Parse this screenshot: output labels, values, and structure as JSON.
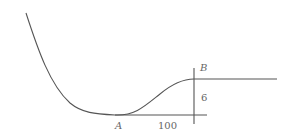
{
  "diagram": {
    "type": "curve-profile",
    "stroke_color": "#555555",
    "labels": {
      "point_a": "A",
      "point_b": "B",
      "height": "6",
      "length": "100"
    },
    "elements": [
      {
        "kind": "curve",
        "description": "steep descent from upper-left, flattening into minimum at A, then S-shaped rise to B"
      },
      {
        "kind": "horizontal-line",
        "description": "baseline through A extending to vertical line"
      },
      {
        "kind": "vertical-line",
        "description": "at B, spanning baseline to above B"
      },
      {
        "kind": "horizontal-line",
        "description": "level line extending right from B"
      }
    ]
  }
}
